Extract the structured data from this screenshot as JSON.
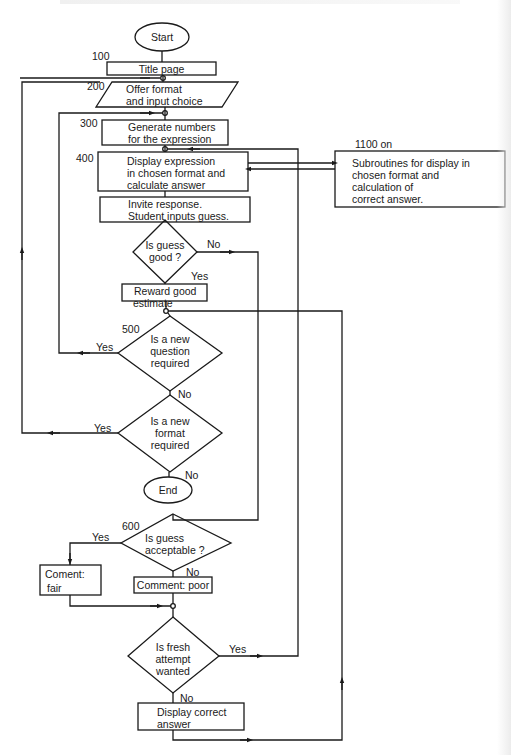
{
  "diagram": {
    "title": "",
    "line_color": "#1a1a1a",
    "background": "#ffffff",
    "nodes": {
      "start": {
        "type": "terminator",
        "label": "Start"
      },
      "title_page": {
        "type": "process",
        "number": "100",
        "label": "Title page"
      },
      "offer_format": {
        "type": "io",
        "number": "200",
        "lines": [
          "Offer format",
          "and input choice"
        ]
      },
      "generate_numbers": {
        "type": "process",
        "number": "300",
        "lines": [
          "Generate numbers",
          "for the expression"
        ]
      },
      "display_expression": {
        "type": "process",
        "number": "400",
        "lines": [
          "Display expression",
          "in chosen format and",
          "calculate answer"
        ]
      },
      "subroutines": {
        "type": "process",
        "number": "1100 on",
        "lines": [
          "Subroutines for display in",
          "chosen format and",
          "calculation of",
          "correct answer."
        ]
      },
      "invite_response": {
        "type": "process",
        "lines": [
          "Invite response.",
          "Student inputs guess."
        ]
      },
      "is_guess_good": {
        "type": "decision",
        "lines": [
          "Is guess",
          "good ?"
        ]
      },
      "reward": {
        "type": "process",
        "lines": [
          "Reward good",
          "estimate"
        ]
      },
      "new_question": {
        "type": "decision",
        "number": "500",
        "lines": [
          "Is a new",
          "question",
          "required"
        ]
      },
      "new_format": {
        "type": "decision",
        "lines": [
          "Is a new",
          "format",
          "required"
        ]
      },
      "end": {
        "type": "terminator",
        "label": "End"
      },
      "guess_acceptable": {
        "type": "decision",
        "number": "600",
        "lines": [
          "Is guess",
          "acceptable ?"
        ]
      },
      "comment_fair": {
        "type": "process",
        "lines": [
          "Coment:",
          "fair"
        ]
      },
      "comment_poor": {
        "type": "process",
        "label": "Comment: poor"
      },
      "fresh_attempt": {
        "type": "decision",
        "lines": [
          "Is fresh",
          "attempt",
          "wanted"
        ]
      },
      "display_correct": {
        "type": "process",
        "lines": [
          "Display correct",
          "answer"
        ]
      }
    },
    "edge_labels": {
      "good_no": "No",
      "good_yes": "Yes",
      "question_yes": "Yes",
      "question_no": "No",
      "format_yes": "Yes",
      "format_no": "No",
      "acceptable_yes": "Yes",
      "acceptable_no": "No",
      "fresh_yes": "Yes",
      "fresh_no": "No"
    },
    "edges": [
      {
        "from": "start",
        "to": "title_page"
      },
      {
        "from": "title_page",
        "to": "offer_format"
      },
      {
        "from": "offer_format",
        "to": "generate_numbers"
      },
      {
        "from": "generate_numbers",
        "to": "display_expression"
      },
      {
        "from": "display_expression",
        "to": "subroutines",
        "bidirectional": true
      },
      {
        "from": "display_expression",
        "to": "invite_response"
      },
      {
        "from": "invite_response",
        "to": "is_guess_good"
      },
      {
        "from": "is_guess_good",
        "to": "reward",
        "label": "Yes"
      },
      {
        "from": "is_guess_good",
        "to": "guess_acceptable",
        "label": "No"
      },
      {
        "from": "reward",
        "to": "new_question"
      },
      {
        "from": "new_question",
        "to": "generate_numbers",
        "label": "Yes"
      },
      {
        "from": "new_question",
        "to": "new_format",
        "label": "No"
      },
      {
        "from": "new_format",
        "to": "offer_format",
        "label": "Yes"
      },
      {
        "from": "new_format",
        "to": "end",
        "label": "No"
      },
      {
        "from": "guess_acceptable",
        "to": "comment_fair",
        "label": "Yes"
      },
      {
        "from": "guess_acceptable",
        "to": "comment_poor",
        "label": "No"
      },
      {
        "from": "comment_fair",
        "to": "fresh_attempt"
      },
      {
        "from": "comment_poor",
        "to": "fresh_attempt"
      },
      {
        "from": "fresh_attempt",
        "to": "display_expression",
        "label": "Yes"
      },
      {
        "from": "fresh_attempt",
        "to": "display_correct",
        "label": "No"
      },
      {
        "from": "display_correct",
        "to": "new_question"
      }
    ]
  }
}
